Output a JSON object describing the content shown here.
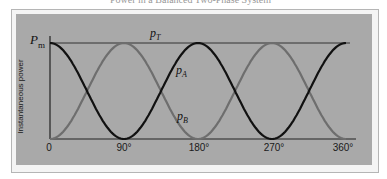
{
  "caption": "Power in a Balanced Two-Phase System",
  "chart_data": {
    "type": "line",
    "title": "Power in a Balanced Two-Phase System",
    "xlabel": "",
    "ylabel": "Instantaneous power",
    "x_ticks": [
      "0",
      "90°",
      "180°",
      "270°",
      "360°"
    ],
    "xlim": [
      0,
      360
    ],
    "ylim": [
      0,
      1
    ],
    "y_ticks": [
      "Pm"
    ],
    "grid": false,
    "legend": "inline labels",
    "x": [
      0,
      22.5,
      45,
      67.5,
      90,
      112.5,
      135,
      157.5,
      180,
      202.5,
      225,
      247.5,
      270,
      292.5,
      315,
      337.5,
      360
    ],
    "series": [
      {
        "name": "p_A",
        "color": "#111111",
        "formula": "Pm*cos^2(theta)",
        "values": [
          1,
          0.854,
          0.5,
          0.146,
          0,
          0.146,
          0.5,
          0.854,
          1,
          0.854,
          0.5,
          0.146,
          0,
          0.146,
          0.5,
          0.854,
          1
        ]
      },
      {
        "name": "p_B",
        "color": "#6e6e6e",
        "formula": "Pm*sin^2(theta)",
        "values": [
          0,
          0.146,
          0.5,
          0.854,
          1,
          0.854,
          0.5,
          0.146,
          0,
          0.146,
          0.5,
          0.854,
          1,
          0.854,
          0.5,
          0.146,
          0
        ]
      },
      {
        "name": "p_T",
        "color": "#333333",
        "formula": "Pm (constant)",
        "values": [
          1,
          1,
          1,
          1,
          1,
          1,
          1,
          1,
          1,
          1,
          1,
          1,
          1,
          1,
          1,
          1,
          1
        ]
      }
    ],
    "annotations": [
      "P_m",
      "p_T",
      "p_A",
      "p_B"
    ]
  },
  "labels": {
    "pm_main": "P",
    "pm_sub": "m",
    "pt_main": "p",
    "pt_sub": "T",
    "pa_main": "p",
    "pa_sub": "A",
    "pb_main": "p",
    "pb_sub": "B",
    "ylabel": "Instantaneous power",
    "tick_0": "0",
    "tick_90": "90°",
    "tick_180": "180°",
    "tick_270": "270°",
    "tick_360": "360°"
  },
  "colors": {
    "panel": "#a9a9a9",
    "curve_a": "#111111",
    "curve_b": "#6e6e6e",
    "axis": "#222222"
  }
}
